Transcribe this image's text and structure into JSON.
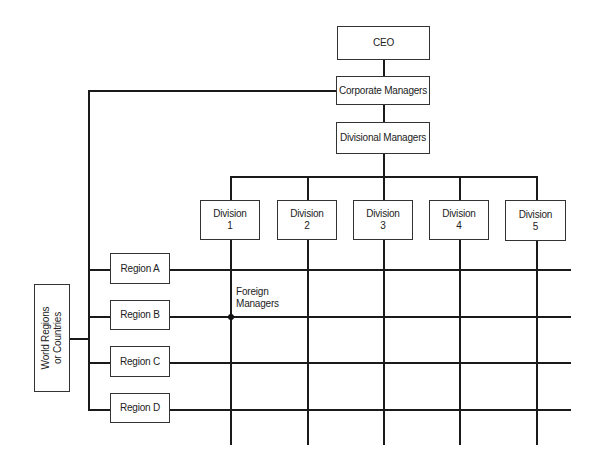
{
  "diagram": {
    "type": "matrix-organization-chart",
    "top": {
      "ceo": "CEO",
      "corporate": "Corporate Managers",
      "divisional": "Divisional Managers"
    },
    "divisions": [
      {
        "line1": "Division",
        "line2": "1"
      },
      {
        "line1": "Division",
        "line2": "2"
      },
      {
        "line1": "Division",
        "line2": "3"
      },
      {
        "line1": "Division",
        "line2": "4"
      },
      {
        "line1": "Division",
        "line2": "5"
      }
    ],
    "regions": [
      "Region A",
      "Region B",
      "Region C",
      "Region D"
    ],
    "world": {
      "line1": "World Regions",
      "line2": "or Countries"
    },
    "annotation": {
      "line1": "Foreign",
      "line2": "Managers"
    }
  }
}
